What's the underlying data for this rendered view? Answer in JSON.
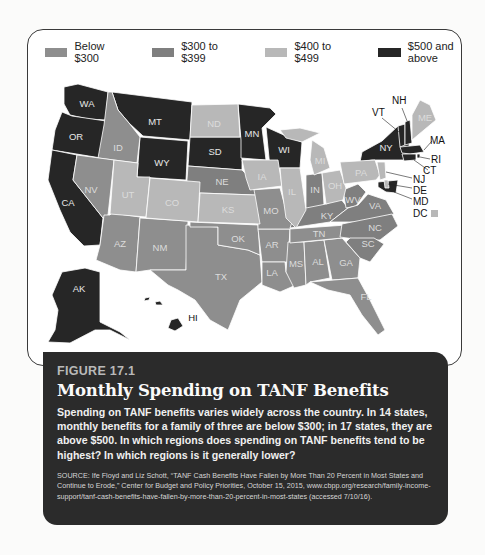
{
  "legend": {
    "items": [
      {
        "label": "Below $300",
        "color": "#8e8e8e"
      },
      {
        "label": "$300 to $399",
        "color": "#7f7f7f"
      },
      {
        "label": "$400 to $499",
        "color": "#b8b8b8"
      },
      {
        "label": "$500 and above",
        "color": "#262626"
      }
    ]
  },
  "categories": {
    "below_300": [
      "ID",
      "NV",
      "AZ",
      "NM",
      "TX",
      "OK",
      "AR",
      "LA",
      "MS",
      "AL",
      "GA",
      "FL",
      "TN",
      "MO"
    ],
    "300_399": [
      "NE",
      "IN",
      "KY",
      "WV",
      "VA",
      "NC",
      "SC"
    ],
    "400_499": [
      "ND",
      "UT",
      "CO",
      "KS",
      "IA",
      "IL",
      "MI",
      "OH",
      "PA",
      "ME",
      "NJ",
      "DE",
      "DC"
    ],
    "500_plus": [
      "WA",
      "OR",
      "CA",
      "MT",
      "WY",
      "SD",
      "MN",
      "WI",
      "NY",
      "VT",
      "NH",
      "MA",
      "RI",
      "CT",
      "MD",
      "AK",
      "HI"
    ]
  },
  "map": {
    "callouts": [
      "NH",
      "VT",
      "MA",
      "RI",
      "CT",
      "NJ",
      "DE",
      "MD",
      "DC"
    ]
  },
  "figure": {
    "number": "FIGURE 17.1",
    "title": "Monthly Spending on TANF Benefits",
    "body": "Spending on TANF benefits varies widely across the country. In 14 states, monthly benefits for a family of three are below $300; in 17 states, they are above $500. In which regions does spending on TANF benefits tend to be highest? In which regions is it generally lower?",
    "source": "SOURCE: Ife Floyd and Liz Schott, “TANF Cash Benefits Have Fallen by More Than 20 Percent in Most States and Continue to Erode,” Center for Budget and Policy Priorities, October 15, 2015, www.cbpp.org/research/family-income-support/tanf-cash-benefits-have-fallen-by-more-than-20-percent-in-most-states (accessed 7/10/16)."
  }
}
